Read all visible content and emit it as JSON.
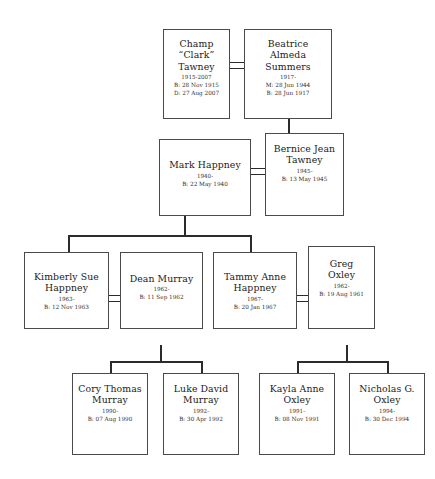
{
  "diagram": {
    "type": "family-tree",
    "generations": 4
  },
  "people": {
    "champ_tawney": {
      "name": "Champ\n“Clark”\nTawney",
      "lifespan": "1915-2007",
      "line1": "B: 28 Nov 1915",
      "line2": "D: 27 Aug 2007"
    },
    "beatrice_summers": {
      "name": "Beatrice\nAlmeda\nSummers",
      "lifespan": "1917-",
      "line1": "M: 28 Jun 1944",
      "line2": "B: 28 Jun 1917"
    },
    "mark_happney": {
      "name": "Mark Happney",
      "lifespan": "1940-",
      "line1": "B: 22 May 1940",
      "line2": ""
    },
    "bernice_tawney": {
      "name": "Bernice Jean\nTawney",
      "lifespan": "1945-",
      "line1": "B: 13 May 1945",
      "line2": ""
    },
    "kimberly_happney": {
      "name": "Kimberly Sue\nHappney",
      "lifespan": "1963-",
      "line1": "B: 12 Nov 1963",
      "line2": ""
    },
    "dean_murray": {
      "name": "Dean Murray",
      "lifespan": "1962-",
      "line1": "B: 11 Sep 1962",
      "line2": ""
    },
    "tammy_happney": {
      "name": "Tammy Anne\nHappney",
      "lifespan": "1967-",
      "line1": "B: 20 Jan 1967",
      "line2": ""
    },
    "greg_oxley": {
      "name": "Greg\nOxley",
      "lifespan": "1962-",
      "line1": "B: 19 Aug 1961",
      "line2": ""
    },
    "cory_murray": {
      "name": "Cory Thomas\nMurray",
      "lifespan": "1990-",
      "line1": "B: 07 Aug 1990",
      "line2": ""
    },
    "luke_murray": {
      "name": "Luke David\nMurray",
      "lifespan": "1992-",
      "line1": "B: 30 Apr 1992",
      "line2": ""
    },
    "kayla_oxley": {
      "name": "Kayla Anne\nOxley",
      "lifespan": "1991-",
      "line1": "B: 08 Nov 1991",
      "line2": ""
    },
    "nicholas_oxley": {
      "name": "Nicholas G.\nOxley",
      "lifespan": "1994-",
      "line1": "B: 30 Dec 1994",
      "line2": ""
    }
  },
  "colors": {
    "background": "#ffffff",
    "box_border": "#4a4a4a",
    "connector": "#2b2b2b",
    "text": "#1a1a1a",
    "text_secondary": "#333333"
  }
}
